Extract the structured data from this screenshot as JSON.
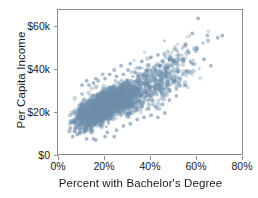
{
  "chart_data": {
    "type": "scatter",
    "title": "",
    "subtitle": "",
    "xlabel": "Percent with Bachelor's Degree",
    "ylabel": "Per Capita Income",
    "xlim": [
      0,
      80
    ],
    "ylim": [
      0,
      65
    ],
    "xticks": [
      0,
      20,
      40,
      60,
      80
    ],
    "xtick_labels": [
      "0%",
      "20%",
      "40%",
      "60%",
      "80%"
    ],
    "yticks": [
      0,
      20,
      40,
      60
    ],
    "ytick_labels": [
      "$0",
      "$20k",
      "$40k",
      "$60k"
    ],
    "grid": false,
    "legend": null,
    "annotations": [],
    "marker": {
      "color": "#6f8fab",
      "opacity": 0.55,
      "size": 2.0,
      "shape": "circle"
    },
    "frame_color": "#8c8c8c",
    "background": "#ffffff",
    "n_points": 3100,
    "cloud": {
      "core": {
        "x_range": [
          4,
          52
        ],
        "y_range": [
          9,
          42
        ],
        "x_mean": 20.0,
        "y_mean": 23.5,
        "x_sd": 7.5,
        "y_sd": 5.0,
        "correlation": 0.78,
        "count": 2600
      },
      "tail": {
        "x_range": [
          25,
          72
        ],
        "y_range": [
          18,
          58
        ],
        "x_mean": 42.0,
        "y_mean": 34.0,
        "x_sd": 9.0,
        "y_sd": 8.0,
        "correlation": 0.72,
        "count": 500
      }
    },
    "points_note": "Point positions are generated from the cloud statistics above to match the rendered density.",
    "series": [
      {
        "name": "Counties",
        "color": "#6f8fab",
        "x_min": 3.5,
        "x_max": 72.0,
        "y_min": 7.5,
        "y_max": 58.0
      }
    ]
  },
  "axes": {
    "y_title": "Per Capita Income",
    "x_title": "Percent with Bachelor's Degree",
    "y_tick_labels": [
      "$60k",
      "$40k",
      "$20k",
      "$0"
    ],
    "x_tick_labels": [
      "0%",
      "20%",
      "40%",
      "60%",
      "80%"
    ]
  }
}
